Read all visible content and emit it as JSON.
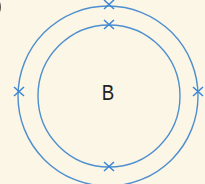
{
  "diagram": {
    "type": "bohr-model",
    "element_symbol": "B",
    "shells": [
      {
        "name": "inner-shell",
        "electrons": 2
      },
      {
        "name": "outer-shell",
        "electrons": 3
      }
    ],
    "colors": {
      "shell": "#4f8fcf",
      "electron": "#3a86d4",
      "background": "#fbf6e6",
      "text": "#222222"
    }
  }
}
